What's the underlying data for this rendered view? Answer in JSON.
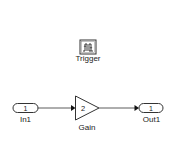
{
  "diagram": {
    "type": "simulink-subsystem",
    "blocks": [
      {
        "id": "trigger",
        "kind": "trigger-port",
        "label": "Trigger"
      },
      {
        "id": "in1",
        "kind": "inport",
        "port_number": "1",
        "label": "In1"
      },
      {
        "id": "gain",
        "kind": "gain",
        "value": "2",
        "label": "Gain"
      },
      {
        "id": "out1",
        "kind": "outport",
        "port_number": "1",
        "label": "Out1"
      }
    ],
    "connections": [
      {
        "from": "In1",
        "to": "Gain"
      },
      {
        "from": "Gain",
        "to": "Out1"
      }
    ],
    "colors": {
      "block_border": "#333333",
      "line": "#333333",
      "background": "#ffffff"
    }
  }
}
